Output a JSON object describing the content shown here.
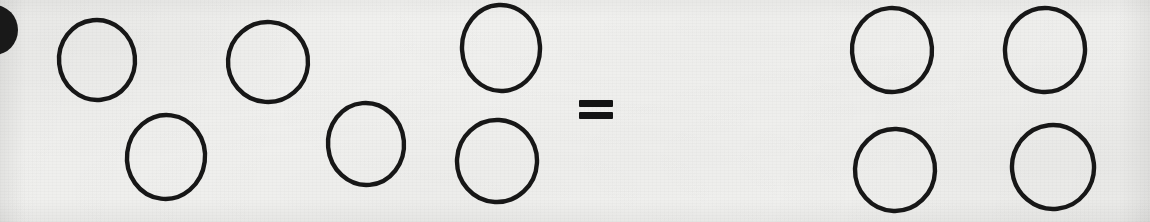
{
  "page": {
    "kind": "scanned-worksheet-photo",
    "width": 1150,
    "height": 222,
    "background_color": "#f3f3f1",
    "ink_color": "#171717"
  },
  "equation": {
    "operator_symbol": "=",
    "operator_name": "equals-sign",
    "left_count_label": "6",
    "right_count_label": "4"
  },
  "left_group": {
    "name": "left-circle-group",
    "count_label": "6",
    "circles": [
      {
        "id": "left-circle-1",
        "label": "circle",
        "cx": 97,
        "cy": 60,
        "rx": 38,
        "ry": 40,
        "rotate": -6,
        "stroke": 4.4,
        "fill": "none"
      },
      {
        "id": "left-circle-2",
        "label": "circle",
        "cx": 268,
        "cy": 62,
        "rx": 40,
        "ry": 40,
        "rotate": 4,
        "stroke": 4.4,
        "fill": "none"
      },
      {
        "id": "left-circle-3",
        "label": "circle",
        "cx": 501,
        "cy": 48,
        "rx": 39,
        "ry": 43,
        "rotate": -3,
        "stroke": 4.4,
        "fill": "none"
      },
      {
        "id": "left-circle-4",
        "label": "circle",
        "cx": 166,
        "cy": 157,
        "rx": 39,
        "ry": 42,
        "rotate": 7,
        "stroke": 4.4,
        "fill": "none"
      },
      {
        "id": "left-circle-5",
        "label": "circle",
        "cx": 366,
        "cy": 144,
        "rx": 38,
        "ry": 41,
        "rotate": -5,
        "stroke": 4.4,
        "fill": "none"
      },
      {
        "id": "left-circle-6",
        "label": "circle",
        "cx": 497,
        "cy": 161,
        "rx": 40,
        "ry": 41,
        "rotate": 3,
        "stroke": 4.4,
        "fill": "none"
      }
    ]
  },
  "right_group": {
    "name": "right-circle-group",
    "count_label": "4",
    "circles": [
      {
        "id": "right-circle-1",
        "label": "circle",
        "cx": 892,
        "cy": 50,
        "rx": 40,
        "ry": 42,
        "rotate": -4,
        "stroke": 4.4,
        "fill": "none"
      },
      {
        "id": "right-circle-2",
        "label": "circle",
        "cx": 1045,
        "cy": 50,
        "rx": 40,
        "ry": 42,
        "rotate": 5,
        "stroke": 4.4,
        "fill": "none"
      },
      {
        "id": "right-circle-3",
        "label": "circle",
        "cx": 895,
        "cy": 170,
        "rx": 40,
        "ry": 41,
        "rotate": 2,
        "stroke": 4.4,
        "fill": "none"
      },
      {
        "id": "right-circle-4",
        "label": "circle",
        "cx": 1053,
        "cy": 167,
        "rx": 41,
        "ry": 42,
        "rotate": -6,
        "stroke": 4.4,
        "fill": "none"
      }
    ]
  },
  "edge_mark": {
    "name": "clipped-filled-dot",
    "label": "filled dot clipped by left page edge",
    "cx": -6,
    "cy": 30,
    "rx": 24,
    "ry": 25,
    "fill": "#1a1a1a"
  },
  "equals_sign": {
    "name": "equals-sign",
    "symbol": "=",
    "x": 579,
    "bar_width": 34,
    "bar_height": 7,
    "top_bar_y": 100,
    "bottom_bar_y": 112,
    "color": "#131313"
  }
}
